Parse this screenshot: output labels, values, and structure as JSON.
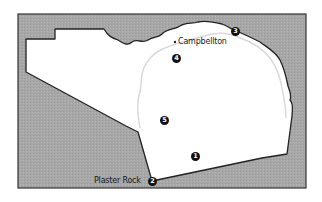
{
  "map": {
    "colors": {
      "background": "#ffffff",
      "water_or_outside": "#a9a9a9",
      "land": "#ffffff",
      "border": "#222222",
      "inner_route": "#d6d6d6"
    },
    "places": [
      {
        "name": "Campbellton",
        "x": 176,
        "y": 42
      },
      {
        "name": "Plaster Rock",
        "x": 94,
        "y": 181
      }
    ],
    "markers": [
      {
        "number": "1",
        "x": 195,
        "y": 156
      },
      {
        "number": "2",
        "x": 152,
        "y": 181
      },
      {
        "number": "3",
        "x": 235,
        "y": 31
      },
      {
        "number": "4",
        "x": 176,
        "y": 58
      },
      {
        "number": "5",
        "x": 164,
        "y": 120
      }
    ]
  }
}
